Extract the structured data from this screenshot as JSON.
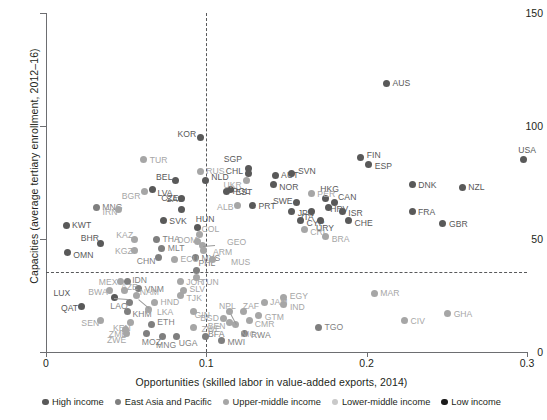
{
  "chart_data": {
    "type": "scatter",
    "title": "",
    "xlabel": "Opportunities (skilled labor in value-added exports, 2014)",
    "ylabel": "Capacities (average tertiary enrollment, 2012–16)",
    "xlim": [
      0,
      0.3
    ],
    "ylim": [
      0,
      150
    ],
    "xticks": [
      "0",
      "0.1",
      "0.2",
      "0.3"
    ],
    "xtickvals": [
      0,
      0.1,
      0.2,
      0.3
    ],
    "yticks": [
      "0",
      "50",
      "100",
      "150"
    ],
    "ytickvals": [
      0,
      50,
      100,
      150
    ],
    "grid": false,
    "reference_lines": {
      "vertical_x": 0.1,
      "horizontal_y": 36
    },
    "legend": {
      "position": "bottom",
      "entries": [
        {
          "label": "High income",
          "color": "#595959"
        },
        {
          "label": "East Asia and Pacific",
          "color": "#7f7f7f"
        },
        {
          "label": "Upper-middle income",
          "color": "#a6a6a6"
        },
        {
          "label": "Lower-middle income",
          "color": "#c9c9c9"
        },
        {
          "label": "Low income",
          "color": "#1a1a1a"
        }
      ]
    },
    "series": [
      {
        "name": "High income",
        "color": "#595959",
        "points": [
          {
            "code": "KOR",
            "x": 0.0964,
            "y": 95,
            "lx": -22,
            "ly": -3
          },
          {
            "code": "BEL",
            "x": 0.0805,
            "y": 76,
            "lx": -21,
            "ly": -3
          },
          {
            "code": "NLD",
            "x": 0.0994,
            "y": 76,
            "lx": 6,
            "ly": -3
          },
          {
            "code": "LVA",
            "x": 0.0664,
            "y": 72,
            "lx": 5,
            "ly": 4
          },
          {
            "code": "CZE",
            "x": 0.0844,
            "y": 68,
            "lx": -21,
            "ly": 0
          },
          {
            "code": "SAU",
            "x": 0.0843,
            "y": 63,
            "lx": -15,
            "ly": -11
          },
          {
            "code": "SGP",
            "x": 0.1265,
            "y": 81,
            "lx": -25,
            "ly": -10
          },
          {
            "code": "CHL",
            "x": 0.1265,
            "y": 79,
            "lx": -24,
            "ly": -2
          },
          {
            "code": "EST",
            "x": 0.1151,
            "y": 72,
            "lx": 5,
            "ly": 3
          },
          {
            "code": "POL",
            "x": 0.1125,
            "y": 71,
            "lx": 6,
            "ly": -1
          },
          {
            "code": "PRT",
            "x": 0.1288,
            "y": 65,
            "lx": 6,
            "ly": 1
          },
          {
            "code": "AUT",
            "x": 0.1429,
            "y": 78,
            "lx": 6,
            "ly": -1
          },
          {
            "code": "NOR",
            "x": 0.1418,
            "y": 74,
            "lx": 6,
            "ly": 2
          },
          {
            "code": "SVN",
            "x": 0.1534,
            "y": 79,
            "lx": 6,
            "ly": -2
          },
          {
            "code": "FIN",
            "x": 0.1963,
            "y": 86,
            "lx": 6,
            "ly": -3
          },
          {
            "code": "ESP",
            "x": 0.2013,
            "y": 83,
            "lx": 6,
            "ly": 2
          },
          {
            "code": "AUS",
            "x": 0.2124,
            "y": 119,
            "lx": 6,
            "ly": 0
          },
          {
            "code": "DNK",
            "x": 0.2285,
            "y": 74,
            "lx": 6,
            "ly": 0
          },
          {
            "code": "NZL",
            "x": 0.2596,
            "y": 73,
            "lx": 6,
            "ly": 0
          },
          {
            "code": "USA",
            "x": 0.2977,
            "y": 85,
            "lx": -5,
            "ly": -10
          },
          {
            "code": "SWE",
            "x": 0.1565,
            "y": 66,
            "lx": -22,
            "ly": -2
          },
          {
            "code": "JPN",
            "x": 0.1532,
            "y": 62,
            "lx": 6,
            "ly": 1
          },
          {
            "code": "ITA",
            "x": 0.1659,
            "y": 62,
            "lx": -16,
            "ly": 5
          },
          {
            "code": "CYP",
            "x": 0.1588,
            "y": 58,
            "lx": 6,
            "ly": 2
          },
          {
            "code": "HKG",
            "x": 0.1741,
            "y": 68,
            "lx": -4,
            "ly": -9
          },
          {
            "code": "CAN",
            "x": 0.1797,
            "y": 66,
            "lx": 4,
            "ly": -6
          },
          {
            "code": "HRV",
            "x": 0.176,
            "y": 64,
            "lx": 2,
            "ly": 2
          },
          {
            "code": "ISR",
            "x": 0.1848,
            "y": 62,
            "lx": 6,
            "ly": 1
          },
          {
            "code": "CHE",
            "x": 0.1886,
            "y": 58,
            "lx": 6,
            "ly": 2
          },
          {
            "code": "URY",
            "x": 0.1709,
            "y": 58,
            "lx": -4,
            "ly": 7
          },
          {
            "code": "FRA",
            "x": 0.2283,
            "y": 62,
            "lx": 6,
            "ly": 0
          },
          {
            "code": "GBR",
            "x": 0.2476,
            "y": 57,
            "lx": 6,
            "ly": 1
          },
          {
            "code": "KWT",
            "x": 0.0125,
            "y": 56,
            "lx": 6,
            "ly": 0
          },
          {
            "code": "BHR",
            "x": 0.0341,
            "y": 48,
            "lx": -20,
            "ly": -6
          },
          {
            "code": "OMN",
            "x": 0.0133,
            "y": 44,
            "lx": 6,
            "ly": 2
          },
          {
            "code": "SVK",
            "x": 0.0732,
            "y": 58,
            "lx": 6,
            "ly": 0
          },
          {
            "code": "HUN",
            "x": 0.0947,
            "y": 55,
            "lx": -1,
            "ly": -9
          },
          {
            "code": "LUX",
            "x": 0.0427,
            "y": 24,
            "lx": -62,
            "ly": -5
          },
          {
            "code": "QAT",
            "x": 0.0224,
            "y": 20,
            "lx": -22,
            "ly": 1
          }
        ]
      },
      {
        "name": "East Asia and Pacific",
        "color": "#7f7f7f",
        "points": [
          {
            "code": "MNG",
            "x": 0.0313,
            "y": 64,
            "lx": 6,
            "ly": 0
          },
          {
            "code": "THA",
            "x": 0.0689,
            "y": 50,
            "lx": 6,
            "ly": 0
          },
          {
            "code": "MLT",
            "x": 0.0722,
            "y": 46,
            "lx": 6,
            "ly": 0
          },
          {
            "code": "CHN",
            "x": 0.0704,
            "y": 42,
            "lx": -21,
            "ly": 4
          },
          {
            "code": "MYS",
            "x": 0.0932,
            "y": 42,
            "lx": 6,
            "ly": 1
          },
          {
            "code": "PHL",
            "x": 0.0939,
            "y": 36,
            "lx": 2,
            "ly": -8
          },
          {
            "code": "IDN",
            "x": 0.0506,
            "y": 31,
            "lx": 5,
            "ly": -2
          },
          {
            "code": "VNM",
            "x": 0.0578,
            "y": 28,
            "lx": 6,
            "ly": 0
          },
          {
            "code": "LAO",
            "x": 0.052,
            "y": 22,
            "lx": -20,
            "ly": 4
          },
          {
            "code": "KHM",
            "x": 0.0508,
            "y": 18,
            "lx": 5,
            "ly": 3
          },
          {
            "code": "TGO",
            "x": 0.1699,
            "y": 11,
            "lx": 6,
            "ly": 0
          },
          {
            "code": "RWA",
            "x": 0.1241,
            "y": 8,
            "lx": 6,
            "ly": 1
          },
          {
            "code": "ETH",
            "x": 0.0657,
            "y": 12,
            "lx": 6,
            "ly": -3
          },
          {
            "code": "MWI",
            "x": 0.1094,
            "y": 5,
            "lx": 6,
            "ly": 1
          },
          {
            "code": "BFA",
            "x": 0.0992,
            "y": 7,
            "lx": 3,
            "ly": -2
          },
          {
            "code": "MOZ",
            "x": 0.0628,
            "y": 8,
            "lx": -4,
            "ly": 8
          },
          {
            "code": "MNG2",
            "x": 0.0724,
            "y": 7,
            "lx": -4,
            "ly": 9
          },
          {
            "code": "UGA",
            "x": 0.0816,
            "y": 7,
            "lx": 2,
            "ly": 7
          }
        ]
      },
      {
        "name": "Upper-middle income",
        "color": "#a6a6a6",
        "points": [
          {
            "code": "TUR",
            "x": 0.061,
            "y": 85,
            "lx": 6,
            "ly": 0
          },
          {
            "code": "RUS",
            "x": 0.0962,
            "y": 80,
            "lx": 6,
            "ly": 0
          },
          {
            "code": "UKR",
            "x": 0.1251,
            "y": 76,
            "lx": -23,
            "ly": 5
          },
          {
            "code": "BGR",
            "x": 0.0616,
            "y": 71,
            "lx": -22,
            "ly": 4
          },
          {
            "code": "IRN",
            "x": 0.0452,
            "y": 63,
            "lx": -19,
            "ly": 2
          },
          {
            "code": "ALB",
            "x": 0.1192,
            "y": 65,
            "lx": -22,
            "ly": 2
          },
          {
            "code": "KAZ",
            "x": 0.0551,
            "y": 50,
            "lx": -19,
            "ly": -4
          },
          {
            "code": "KGZ",
            "x": 0.0549,
            "y": 45,
            "lx": -19,
            "ly": 1
          },
          {
            "code": "PER",
            "x": 0.1655,
            "y": 70,
            "lx": 6,
            "ly": 0
          },
          {
            "code": "COL",
            "x": 0.0958,
            "y": 52,
            "lx": 2,
            "ly": -5
          },
          {
            "code": "DOM",
            "x": 0.0944,
            "y": 49,
            "lx": -18,
            "ly": -1
          },
          {
            "code": "GEO",
            "x": 0.0979,
            "y": 47,
            "lx": 24,
            "ly": -4
          },
          {
            "code": "ARM",
            "x": 0.0985,
            "y": 45,
            "lx": 9,
            "ly": 2
          },
          {
            "code": "MUS",
            "x": 0.1036,
            "y": 41,
            "lx": 19,
            "ly": 3
          },
          {
            "code": "CRI",
            "x": 0.1611,
            "y": 54,
            "lx": 6,
            "ly": 2
          },
          {
            "code": "BRA",
            "x": 0.1745,
            "y": 51,
            "lx": 6,
            "ly": 2
          },
          {
            "code": "ECU",
            "x": 0.0802,
            "y": 41,
            "lx": 6,
            "ly": 0
          },
          {
            "code": "TUN",
            "x": 0.0941,
            "y": 33,
            "lx": 4,
            "ly": 5
          },
          {
            "code": "JOR",
            "x": 0.0837,
            "y": 31,
            "lx": 6,
            "ly": 0
          },
          {
            "code": "MEX",
            "x": 0.0466,
            "y": 31,
            "lx": -21,
            "ly": 0
          },
          {
            "code": "BWA",
            "x": 0.0395,
            "y": 27,
            "lx": -20,
            "ly": 1
          },
          {
            "code": "AZE",
            "x": 0.0492,
            "y": 27,
            "lx": -5,
            "ly": -4
          },
          {
            "code": "NAM",
            "x": 0.0566,
            "y": 25,
            "lx": 3,
            "ly": -4
          },
          {
            "code": "SLV",
            "x": 0.0857,
            "y": 27,
            "lx": 6,
            "ly": -2
          },
          {
            "code": "TJK",
            "x": 0.0839,
            "y": 25,
            "lx": 6,
            "ly": 2
          },
          {
            "code": "HND",
            "x": 0.0676,
            "y": 22,
            "lx": 6,
            "ly": 0
          },
          {
            "code": "LKA",
            "x": 0.0642,
            "y": 19,
            "lx": 8,
            "ly": 3
          },
          {
            "code": "JAM",
            "x": 0.136,
            "y": 22,
            "lx": 6,
            "ly": 0
          },
          {
            "code": "EGY",
            "x": 0.1483,
            "y": 24,
            "lx": 6,
            "ly": -2
          },
          {
            "code": "IND",
            "x": 0.1484,
            "y": 21,
            "lx": 6,
            "ly": 2
          },
          {
            "code": "ZAF",
            "x": 0.1233,
            "y": 18,
            "lx": -3,
            "ly": -5
          },
          {
            "code": "GTM",
            "x": 0.1327,
            "y": 16,
            "lx": 6,
            "ly": 1
          },
          {
            "code": "CMR",
            "x": 0.1271,
            "y": 14,
            "lx": 5,
            "ly": 4
          },
          {
            "code": "NPL",
            "x": 0.1147,
            "y": 18,
            "lx": -12,
            "ly": -5
          },
          {
            "code": "BGD",
            "x": 0.1105,
            "y": 15,
            "lx": -22,
            "ly": 0
          },
          {
            "code": "BEN",
            "x": 0.1146,
            "y": 13,
            "lx": -22,
            "ly": 3
          },
          {
            "code": "NIC",
            "x": 0.1184,
            "y": 12,
            "lx": 5,
            "ly": 9
          },
          {
            "code": "GIN",
            "x": 0.092,
            "y": 18,
            "lx": -2,
            "ly": 4
          },
          {
            "code": "ZWE",
            "x": 0.092,
            "y": 11,
            "lx": 8,
            "ly": 2
          },
          {
            "code": "SEN",
            "x": 0.0339,
            "y": 14,
            "lx": -19,
            "ly": 3
          },
          {
            "code": "KEN",
            "x": 0.053,
            "y": 13,
            "lx": -18,
            "ly": 5
          },
          {
            "code": "ZMB",
            "x": 0.0498,
            "y": 10,
            "lx": -17,
            "ly": 5
          },
          {
            "code": "ZWE2",
            "x": 0.0499,
            "y": 8,
            "lx": -18,
            "ly": 6
          },
          {
            "code": "MAR",
            "x": 0.2047,
            "y": 26,
            "lx": 6,
            "ly": 0
          },
          {
            "code": "GHA",
            "x": 0.2505,
            "y": 17,
            "lx": 6,
            "ly": 0
          },
          {
            "code": "CIV",
            "x": 0.2236,
            "y": 14,
            "lx": 6,
            "ly": 1
          }
        ]
      },
      {
        "name": "Low income",
        "color": "#1a1a1a",
        "points": []
      }
    ]
  }
}
